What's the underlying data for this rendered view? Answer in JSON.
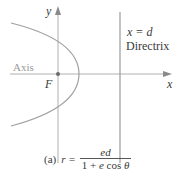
{
  "labels": {
    "y_axis": "y",
    "x_axis": "x",
    "focus": "F",
    "axis": "Axis",
    "directrix_eq": "x = d",
    "directrix": "Directrix"
  },
  "caption": {
    "tag": "(a)",
    "lhs": "r =",
    "numerator": "ed",
    "denominator_prefix": "1 + ",
    "denominator_e": "e",
    "denominator_cos": " cos ",
    "denominator_theta": "θ"
  },
  "colors": {
    "axis_line": "#b0b0b0",
    "curve": "#a0a0a0",
    "directrix_line": "#9a9a9a",
    "focus_dot": "#6a6a6a",
    "text": "#3a3a3a",
    "axis_label": "#9a9a9a"
  }
}
